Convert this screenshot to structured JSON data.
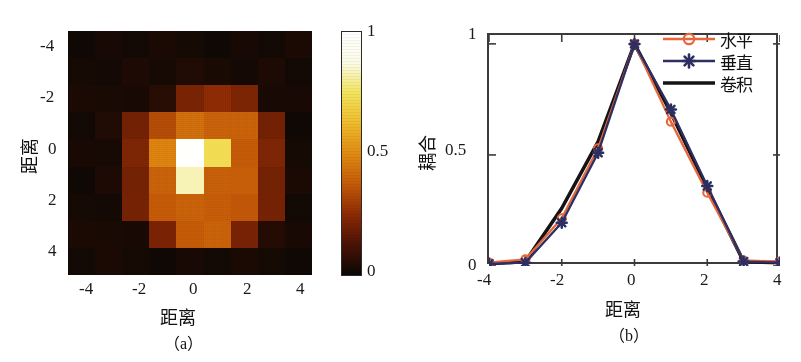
{
  "figure": {
    "background": "#ffffff",
    "panels": [
      {
        "caption": "（a）",
        "type": "heatmap"
      },
      {
        "caption": "（b）",
        "type": "line"
      }
    ]
  },
  "panel_a": {
    "caption": "（a）",
    "xlabel": "距离",
    "ylabel": "距离",
    "xticks": [
      "-4",
      "-2",
      "0",
      "2",
      "4"
    ],
    "yticks": [
      "-4",
      "-2",
      "0",
      "2",
      "4"
    ],
    "colorbar": {
      "name": "hot",
      "ticks": [
        "1",
        "0.5",
        "0"
      ],
      "stops": [
        "#0b0704",
        "#4a1205",
        "#8c2a04",
        "#c35a08",
        "#e08a12",
        "#eebb2b",
        "#f2e45c",
        "#fbfbe8",
        "#ffffff"
      ]
    }
  },
  "panel_b": {
    "caption": "（b）",
    "xlabel": "距离",
    "ylabel": "耦合",
    "xticks": [
      "-4",
      "-2",
      "0",
      "2",
      "4"
    ],
    "yticks": [
      "0",
      "0.5",
      "1"
    ],
    "legend": [
      {
        "label": "水平",
        "marker": "circle",
        "color": "#e8663c"
      },
      {
        "label": "垂直",
        "marker": "star",
        "color": "#2d2f63"
      },
      {
        "label": "卷积",
        "marker": "none",
        "color": "#141414"
      }
    ]
  },
  "chart_data": [
    {
      "type": "heatmap",
      "title": "",
      "xlabel": "距离",
      "ylabel": "距离",
      "xlim": [
        -4.5,
        4.5
      ],
      "ylim": [
        -4.5,
        4.5
      ],
      "xticks": [
        -4,
        -2,
        0,
        2,
        4
      ],
      "yticks": [
        -4,
        -2,
        0,
        2,
        4
      ],
      "colormap": "hot",
      "clim": [
        0,
        1
      ],
      "colorbar_ticks": [
        0,
        0.5,
        1
      ],
      "x": [
        -4,
        -3,
        -2,
        -1,
        0,
        1,
        2,
        3,
        4
      ],
      "y": [
        -4,
        -3,
        -2,
        -1,
        0,
        1,
        2,
        3,
        4
      ],
      "values": [
        [
          0.02,
          0.02,
          0.02,
          0.02,
          0.02,
          0.02,
          0.02,
          0.02,
          0.02
        ],
        [
          0.02,
          0.03,
          0.03,
          0.03,
          0.03,
          0.03,
          0.03,
          0.03,
          0.02
        ],
        [
          0.02,
          0.03,
          0.04,
          0.05,
          0.22,
          0.24,
          0.22,
          0.04,
          0.02
        ],
        [
          0.02,
          0.03,
          0.2,
          0.35,
          0.42,
          0.4,
          0.38,
          0.2,
          0.02
        ],
        [
          0.02,
          0.03,
          0.21,
          0.48,
          1.0,
          0.72,
          0.38,
          0.21,
          0.02
        ],
        [
          0.02,
          0.03,
          0.21,
          0.38,
          0.83,
          0.4,
          0.38,
          0.21,
          0.02
        ],
        [
          0.02,
          0.03,
          0.2,
          0.38,
          0.38,
          0.38,
          0.38,
          0.2,
          0.02
        ],
        [
          0.02,
          0.03,
          0.04,
          0.21,
          0.38,
          0.38,
          0.21,
          0.06,
          0.02
        ],
        [
          0.02,
          0.02,
          0.02,
          0.02,
          0.02,
          0.02,
          0.02,
          0.02,
          0.02
        ]
      ]
    },
    {
      "type": "line",
      "title": "",
      "xlabel": "距离",
      "ylabel": "耦合",
      "xlim": [
        -4,
        4
      ],
      "ylim": [
        0,
        1.04
      ],
      "xticks": [
        -4,
        -2,
        0,
        2,
        4
      ],
      "yticks": [
        0,
        0.5,
        1
      ],
      "grid": false,
      "legend_position": "top-right",
      "x": [
        -4,
        -3,
        -2,
        -1,
        0,
        1,
        2,
        3,
        4
      ],
      "series": [
        {
          "name": "水平",
          "color": "#e8663c",
          "marker": "circle",
          "values": [
            0.015,
            0.03,
            0.215,
            0.53,
            1.0,
            0.65,
            0.33,
            0.025,
            0.02
          ]
        },
        {
          "name": "垂直",
          "color": "#2d2f63",
          "marker": "star",
          "values": [
            0.01,
            0.015,
            0.195,
            0.51,
            1.0,
            0.705,
            0.36,
            0.02,
            0.015
          ]
        },
        {
          "name": "卷积",
          "color": "#141414",
          "marker": "none",
          "values": [
            0.01,
            0.02,
            0.26,
            0.56,
            1.0,
            0.69,
            0.35,
            0.02,
            0.015
          ]
        }
      ]
    }
  ]
}
